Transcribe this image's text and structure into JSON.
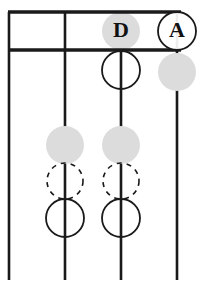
{
  "figure": {
    "title": "",
    "background_color": "#ffffff",
    "width": 203,
    "height": 291
  },
  "palette": {
    "stroke": "#1a1a1a",
    "gray_fill": "#dcdcdc",
    "white_fill": "#ffffff",
    "text": "#111111"
  },
  "header": {
    "name": "header-rule-box",
    "top_rule_y": 12,
    "bottom_rule_y": 50,
    "x_start": 8,
    "x_end": 181,
    "stroke_width": 3.2
  },
  "stems": [
    {
      "id": "stem-1",
      "x": 9,
      "y_top": 12,
      "y_bottom": 280
    },
    {
      "id": "stem-2",
      "x": 65,
      "y_top": 12,
      "y_bottom": 280
    },
    {
      "id": "stem-3",
      "x": 121,
      "y_top": 12,
      "y_bottom": 280
    },
    {
      "id": "stem-4",
      "x": 177,
      "y_top": 12,
      "y_bottom": 280
    }
  ],
  "nodes": [
    {
      "id": "node-d-head",
      "label": "D",
      "style": "gray-filled",
      "cx": 121,
      "cy": 31,
      "r": 19,
      "has_label": true
    },
    {
      "id": "node-a-head",
      "label": "A",
      "style": "outlined",
      "cx": 177,
      "cy": 31,
      "r": 19,
      "has_label": true
    },
    {
      "id": "node-stem3-solid-top",
      "label": "",
      "style": "outlined",
      "cx": 121,
      "cy": 70,
      "r": 19,
      "has_label": false
    },
    {
      "id": "node-stem4-gray-top",
      "label": "",
      "style": "gray-filled",
      "cx": 177,
      "cy": 72,
      "r": 19,
      "has_label": false
    },
    {
      "id": "node-stem2-gray",
      "label": "",
      "style": "gray-filled",
      "cx": 65,
      "cy": 145,
      "r": 19,
      "has_label": false
    },
    {
      "id": "node-stem2-dashed",
      "label": "",
      "style": "dashed",
      "cx": 65,
      "cy": 181,
      "r": 18,
      "has_label": false
    },
    {
      "id": "node-stem2-solid",
      "label": "",
      "style": "outlined",
      "cx": 65,
      "cy": 218,
      "r": 19,
      "has_label": false
    },
    {
      "id": "node-stem3-gray",
      "label": "",
      "style": "gray-filled",
      "cx": 121,
      "cy": 145,
      "r": 19,
      "has_label": false
    },
    {
      "id": "node-stem3-dashed",
      "label": "",
      "style": "dashed",
      "cx": 121,
      "cy": 181,
      "r": 18,
      "has_label": false
    },
    {
      "id": "node-stem3-solid",
      "label": "",
      "style": "outlined",
      "cx": 121,
      "cy": 218,
      "r": 19,
      "has_label": false
    }
  ],
  "labels": {
    "d": "D",
    "a": "A",
    "font_size": 22
  }
}
